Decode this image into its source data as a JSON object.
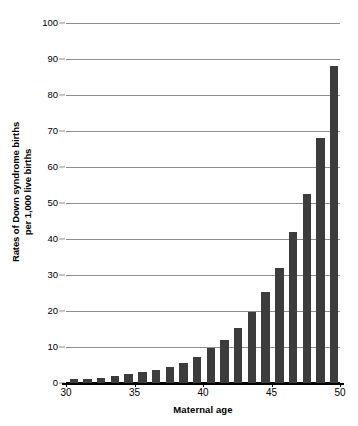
{
  "chart_data": {
    "type": "bar",
    "title": "",
    "xlabel": "Maternal age",
    "ylabel": "Rates of Down syndrome births per 1,000 live births",
    "ylabel_line1": "Rates of Down syndrome births",
    "ylabel_line2": "per 1,000 live births",
    "categories": [
      30,
      31,
      32,
      33,
      34,
      35,
      36,
      37,
      38,
      39,
      40,
      41,
      42,
      43,
      44,
      45,
      46,
      47,
      48,
      49,
      50
    ],
    "values": [
      1.0,
      1.2,
      1.4,
      1.9,
      2.5,
      3.0,
      3.7,
      4.4,
      5.6,
      7.2,
      9.8,
      11.9,
      15.4,
      19.7,
      25.3,
      32.0,
      41.9,
      52.6,
      68.0,
      88.0,
      0
    ],
    "series": [
      {
        "name": "Rates of Down syndrome births per 1,000 live births",
        "values": [
          1.0,
          1.2,
          1.4,
          1.9,
          2.5,
          3.0,
          3.7,
          4.4,
          5.6,
          7.2,
          9.8,
          11.9,
          15.4,
          19.7,
          25.3,
          32.0,
          41.9,
          52.6,
          68.0,
          88.0,
          0
        ]
      }
    ],
    "ylim": [
      0,
      100
    ],
    "xlim": [
      30,
      50
    ],
    "ytick_labels": [
      "0",
      "10",
      "20",
      "30",
      "40",
      "50",
      "60",
      "70",
      "80",
      "90",
      "100"
    ],
    "ytick_values": [
      0,
      10,
      20,
      30,
      40,
      50,
      60,
      70,
      80,
      90,
      100
    ],
    "xtick_labels": [
      "30",
      "35",
      "40",
      "45",
      "50"
    ],
    "xtick_values": [
      30,
      35,
      40,
      45,
      50
    ],
    "grid": true,
    "grid_axis": "y",
    "legend": false,
    "legend_position": "none",
    "bar_color": "#3c3c3c",
    "gridline_color": "#8d8d8d",
    "axis_color": "#000000",
    "background_color": "#ffffff"
  }
}
